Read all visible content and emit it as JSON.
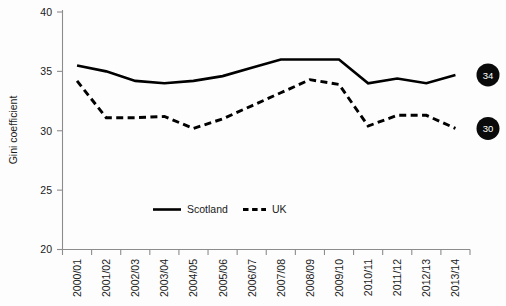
{
  "chart_data": {
    "type": "line",
    "title": "",
    "xlabel": "",
    "ylabel": "Gini coefficient",
    "ylim": [
      20,
      40
    ],
    "yticks": [
      20,
      25,
      30,
      35,
      40
    ],
    "grid": false,
    "legend_position": "bottom-center",
    "categories": [
      "2000/01",
      "2001/02",
      "2002/03",
      "2003/04",
      "2004/05",
      "2005/06",
      "2006/07",
      "2007/08",
      "2008/09",
      "2009/10",
      "2010/11",
      "2011/12",
      "2012/13",
      "2013/14"
    ],
    "series": [
      {
        "name": "Scotland",
        "style": "solid",
        "color": "#000000",
        "values": [
          35.5,
          35.0,
          34.2,
          34.0,
          34.2,
          34.6,
          35.3,
          36.0,
          36.0,
          36.0,
          34.0,
          34.4,
          34.0,
          34.7
        ]
      },
      {
        "name": "UK",
        "style": "dashed",
        "color": "#000000",
        "values": [
          34.2,
          31.1,
          31.1,
          31.2,
          30.2,
          31.0,
          32.1,
          33.2,
          34.3,
          33.9,
          30.4,
          31.3,
          31.3,
          30.2
        ]
      }
    ],
    "annotations": [
      {
        "series": "Scotland",
        "label": "34",
        "at_category": "2013/14"
      },
      {
        "series": "UK",
        "label": "30",
        "at_category": "2013/14"
      }
    ]
  },
  "legend": {
    "items": [
      {
        "label": "Scotland",
        "style": "solid"
      },
      {
        "label": "UK",
        "style": "dashed"
      }
    ]
  },
  "axes": {
    "y_title": "Gini coefficient",
    "y_tick_labels": [
      "40",
      "35",
      "30",
      "25",
      "20"
    ],
    "x_tick_labels": [
      "2000/01",
      "2001/02",
      "2002/03",
      "2003/04",
      "2004/05",
      "2005/06",
      "2006/07",
      "2007/08",
      "2008/09",
      "2009/10",
      "2010/11",
      "2011/12",
      "2012/13",
      "2013/14"
    ]
  }
}
